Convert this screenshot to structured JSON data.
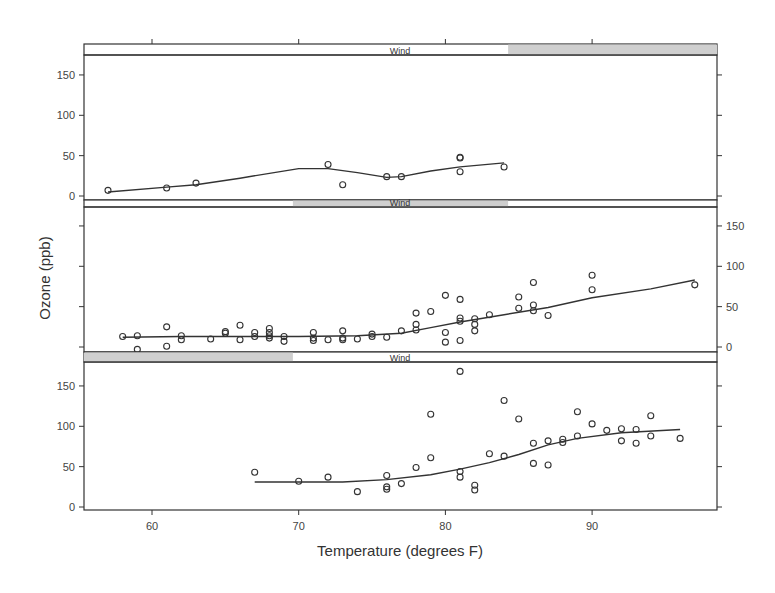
{
  "chart_data": {
    "type": "scatter",
    "title": "",
    "xlabel": "Temperature (degrees F)",
    "ylabel": "Ozone (ppb)",
    "xlim": [
      55.5,
      98.5
    ],
    "ylim": [
      -5,
      175
    ],
    "x_ticks": [
      60,
      70,
      80,
      90
    ],
    "y_ticks": [
      0,
      50,
      100,
      150
    ],
    "grid": false,
    "layout": "3 stacked conditioning panels (coplot), shared x-axis; y tick labels alternate left/right",
    "strip_label": "Wind",
    "panels": [
      {
        "name": "Wind high",
        "strip_label": "Wind",
        "shade_range_fraction": [
          0.67,
          1.0
        ],
        "y_labels_side": "left",
        "points": [
          [
            57,
            7
          ],
          [
            61,
            10
          ],
          [
            63,
            16
          ],
          [
            72,
            39
          ],
          [
            73,
            14
          ],
          [
            76,
            24
          ],
          [
            77,
            24
          ],
          [
            81,
            30
          ],
          [
            81,
            47
          ],
          [
            81,
            48
          ],
          [
            84,
            36
          ]
        ],
        "smooth": [
          [
            57,
            5
          ],
          [
            61,
            11
          ],
          [
            63,
            14
          ],
          [
            66,
            22
          ],
          [
            70,
            34
          ],
          [
            72,
            34
          ],
          [
            74,
            29
          ],
          [
            76,
            23
          ],
          [
            77,
            24
          ],
          [
            79,
            31
          ],
          [
            81,
            36
          ],
          [
            84,
            41
          ]
        ]
      },
      {
        "name": "Wind medium",
        "strip_label": "Wind",
        "shade_range_fraction": [
          0.33,
          0.67
        ],
        "y_labels_side": "right",
        "points": [
          [
            58,
            13
          ],
          [
            59,
            14
          ],
          [
            59,
            -3
          ],
          [
            61,
            25
          ],
          [
            61,
            1
          ],
          [
            62,
            14
          ],
          [
            62,
            9
          ],
          [
            64,
            10
          ],
          [
            65,
            19
          ],
          [
            65,
            17
          ],
          [
            66,
            27
          ],
          [
            66,
            9
          ],
          [
            67,
            18
          ],
          [
            67,
            13
          ],
          [
            68,
            23
          ],
          [
            68,
            18
          ],
          [
            68,
            14
          ],
          [
            68,
            11
          ],
          [
            69,
            13
          ],
          [
            69,
            7
          ],
          [
            71,
            18
          ],
          [
            71,
            11
          ],
          [
            71,
            8
          ],
          [
            72,
            9
          ],
          [
            73,
            20
          ],
          [
            73,
            11
          ],
          [
            73,
            9
          ],
          [
            74,
            10
          ],
          [
            75,
            16
          ],
          [
            75,
            13
          ],
          [
            76,
            12
          ],
          [
            77,
            20
          ],
          [
            78,
            21
          ],
          [
            78,
            28
          ],
          [
            78,
            42
          ],
          [
            79,
            44
          ],
          [
            80,
            64
          ],
          [
            80,
            18
          ],
          [
            80,
            6
          ],
          [
            81,
            59
          ],
          [
            81,
            36
          ],
          [
            81,
            32
          ],
          [
            81,
            8
          ],
          [
            82,
            35
          ],
          [
            82,
            28
          ],
          [
            82,
            20
          ],
          [
            83,
            40
          ],
          [
            85,
            62
          ],
          [
            85,
            48
          ],
          [
            86,
            80
          ],
          [
            86,
            52
          ],
          [
            86,
            45
          ],
          [
            87,
            39
          ],
          [
            90,
            89
          ],
          [
            90,
            71
          ],
          [
            97,
            77
          ]
        ],
        "smooth": [
          [
            58,
            12
          ],
          [
            62,
            13
          ],
          [
            66,
            13
          ],
          [
            70,
            13
          ],
          [
            74,
            14
          ],
          [
            77,
            17
          ],
          [
            79,
            24
          ],
          [
            81,
            31
          ],
          [
            84,
            40
          ],
          [
            87,
            49
          ],
          [
            90,
            61
          ],
          [
            94,
            72
          ],
          [
            97,
            83
          ]
        ]
      },
      {
        "name": "Wind low",
        "strip_label": "Wind",
        "shade_range_fraction": [
          0.0,
          0.33
        ],
        "y_labels_side": "left",
        "points": [
          [
            67,
            43
          ],
          [
            70,
            32
          ],
          [
            72,
            37
          ],
          [
            74,
            19
          ],
          [
            76,
            39
          ],
          [
            76,
            25
          ],
          [
            76,
            22
          ],
          [
            77,
            29
          ],
          [
            78,
            49
          ],
          [
            79,
            115
          ],
          [
            79,
            61
          ],
          [
            81,
            168
          ],
          [
            81,
            44
          ],
          [
            81,
            37
          ],
          [
            82,
            27
          ],
          [
            82,
            21
          ],
          [
            83,
            66
          ],
          [
            84,
            132
          ],
          [
            84,
            63
          ],
          [
            85,
            109
          ],
          [
            86,
            79
          ],
          [
            86,
            54
          ],
          [
            87,
            82
          ],
          [
            87,
            52
          ],
          [
            88,
            84
          ],
          [
            88,
            80
          ],
          [
            89,
            118
          ],
          [
            89,
            88
          ],
          [
            90,
            103
          ],
          [
            91,
            95
          ],
          [
            92,
            97
          ],
          [
            92,
            82
          ],
          [
            93,
            96
          ],
          [
            93,
            79
          ],
          [
            94,
            113
          ],
          [
            94,
            88
          ],
          [
            96,
            85
          ]
        ],
        "smooth": [
          [
            67,
            31
          ],
          [
            70,
            31
          ],
          [
            73,
            31
          ],
          [
            76,
            34
          ],
          [
            79,
            40
          ],
          [
            81,
            47
          ],
          [
            83,
            55
          ],
          [
            85,
            65
          ],
          [
            87,
            77
          ],
          [
            89,
            85
          ],
          [
            92,
            92
          ],
          [
            96,
            96
          ]
        ]
      }
    ]
  }
}
